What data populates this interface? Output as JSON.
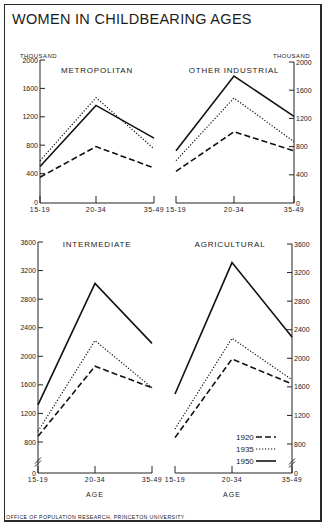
{
  "title": "WOMEN IN CHILDBEARING AGES",
  "footer": "OFFICE OF POPULATION RESEARCH, PRINCETON UNIVERSITY",
  "unit_label": "THOUSAND",
  "x_axis_label": "AGE",
  "legend": [
    {
      "year": "1920",
      "style": "dashed"
    },
    {
      "year": "1935",
      "style": "dotted"
    },
    {
      "year": "1950",
      "style": "solid"
    }
  ],
  "chart_data": [
    {
      "type": "line",
      "title": "METROPOLITAN",
      "xlabel": "",
      "ylabel": "THOUSAND",
      "categories": [
        "15-19",
        "20-34",
        "35-49"
      ],
      "yticks": [
        0,
        400,
        800,
        1200,
        1600,
        2000
      ],
      "ylim": [
        0,
        2000
      ],
      "axis_side": "left",
      "series": [
        {
          "name": "1920",
          "values": [
            350,
            780,
            480
          ]
        },
        {
          "name": "1935",
          "values": [
            580,
            1470,
            750
          ]
        },
        {
          "name": "1950",
          "values": [
            500,
            1360,
            900
          ]
        }
      ]
    },
    {
      "type": "line",
      "title": "OTHER INDUSTRIAL",
      "xlabel": "",
      "ylabel": "THOUSAND",
      "categories": [
        "15-19",
        "20-34",
        "35-49"
      ],
      "yticks": [
        0,
        400,
        800,
        1200,
        1600,
        2000
      ],
      "ylim": [
        0,
        2000
      ],
      "axis_side": "right",
      "series": [
        {
          "name": "1920",
          "values": [
            450,
            1010,
            740
          ]
        },
        {
          "name": "1935",
          "values": [
            600,
            1490,
            870
          ]
        },
        {
          "name": "1950",
          "values": [
            740,
            1800,
            1230
          ]
        }
      ]
    },
    {
      "type": "line",
      "title": "INTERMEDIATE",
      "xlabel": "AGE",
      "ylabel": "",
      "categories": [
        "15-19",
        "20-34",
        "35-49"
      ],
      "yticks": [
        0,
        800,
        1200,
        1600,
        2000,
        2400,
        2800,
        3200,
        3600
      ],
      "ylim": [
        0,
        3600
      ],
      "axis_break": [
        0,
        800
      ],
      "axis_side": "left",
      "series": [
        {
          "name": "1920",
          "values": [
            880,
            1860,
            1560
          ]
        },
        {
          "name": "1935",
          "values": [
            950,
            2220,
            1560
          ]
        },
        {
          "name": "1950",
          "values": [
            1320,
            3020,
            2180
          ]
        }
      ]
    },
    {
      "type": "line",
      "title": "AGRICULTURAL",
      "xlabel": "AGE",
      "ylabel": "",
      "categories": [
        "15-19",
        "20-34",
        "35-49"
      ],
      "yticks": [
        0,
        800,
        1200,
        1600,
        2000,
        2400,
        2800,
        3200,
        3600
      ],
      "ylim": [
        0,
        3600
      ],
      "axis_break": [
        0,
        800
      ],
      "axis_side": "right",
      "series": [
        {
          "name": "1920",
          "values": [
            890,
            1990,
            1640
          ]
        },
        {
          "name": "1935",
          "values": [
            1010,
            2280,
            1700
          ]
        },
        {
          "name": "1950",
          "values": [
            1500,
            3340,
            2300
          ]
        }
      ]
    }
  ]
}
